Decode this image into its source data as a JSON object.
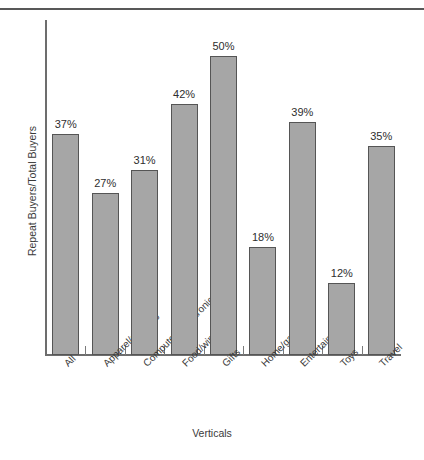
{
  "page": {
    "top_text_sliver": "r r r       r   r"
  },
  "chart_data": {
    "type": "bar",
    "title": "",
    "xlabel": "Verticals",
    "ylabel": "Repeat Buyers/Total Buyers",
    "categories": [
      "All",
      "Apparel/sporting",
      "Computers/electronics",
      "Food/wine",
      "Gifts",
      "Home/garden",
      "Entertainment",
      "Toys",
      "Travel"
    ],
    "values": [
      37,
      27,
      31,
      42,
      50,
      18,
      39,
      12,
      35
    ],
    "value_labels": [
      "37%",
      "27%",
      "31%",
      "42%",
      "50%",
      "18%",
      "39%",
      "12%",
      "35%"
    ],
    "ylim": [
      0,
      56
    ],
    "grid": false,
    "legend": null,
    "axis_tick_labels_y": [],
    "bar_color": "#a6a6a6",
    "bar_border_color": "#555555",
    "axis_color": "#6d6d6d",
    "text_color": "#3a3a3a"
  }
}
